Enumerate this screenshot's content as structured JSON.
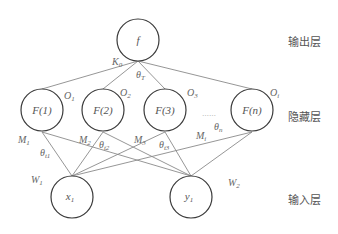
{
  "diagram": {
    "type": "neural-network",
    "layers": {
      "output": {
        "label": "输出层"
      },
      "hidden": {
        "label": "隐藏层"
      },
      "input": {
        "label": "输入层"
      }
    },
    "nodes": {
      "output": {
        "label": "f"
      },
      "hidden": [
        {
          "label": "F(1)"
        },
        {
          "label": "F(2)"
        },
        {
          "label": "F(3)"
        },
        {
          "label": "F(n)"
        }
      ],
      "ellipsis": "……",
      "input": [
        {
          "label": "x",
          "sub": "1"
        },
        {
          "label": "y",
          "sub": "1"
        }
      ]
    },
    "parameters": {
      "K0": {
        "base": "K",
        "sub": "0"
      },
      "thetaT": {
        "base": "θ",
        "sub": "T"
      },
      "O1": {
        "base": "O",
        "sub": "1"
      },
      "O2": {
        "base": "O",
        "sub": "2"
      },
      "O3": {
        "base": "O",
        "sub": "3"
      },
      "Oi": {
        "base": "O",
        "sub": "i"
      },
      "M1": {
        "base": "M",
        "sub": "1"
      },
      "M2": {
        "base": "M",
        "sub": "2"
      },
      "M3": {
        "base": "M",
        "sub": "3"
      },
      "Mi": {
        "base": "M",
        "sub": "i"
      },
      "thetaT1": {
        "base": "θ",
        "sub": "t1"
      },
      "thetaT2": {
        "base": "θ",
        "sub": "t2"
      },
      "thetaT3": {
        "base": "θ",
        "sub": "t3"
      },
      "thetaN": {
        "base": "θ",
        "sub": "n"
      },
      "W1": {
        "base": "W",
        "sub": "1"
      },
      "W2": {
        "base": "W",
        "sub": "2"
      }
    }
  }
}
